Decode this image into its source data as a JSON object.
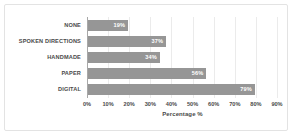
{
  "chart_data": {
    "type": "bar",
    "orientation": "horizontal",
    "title": "",
    "categories": [
      "NONE",
      "SPOKEN DIRECTIONS",
      "HANDMADE",
      "PAPER",
      "DIGITAL"
    ],
    "values": [
      19,
      37,
      34,
      56,
      79
    ],
    "value_labels": [
      "19%",
      "37%",
      "34%",
      "56%",
      "79%"
    ],
    "xlabel": "Percentage %",
    "ylabel": "",
    "xlim": [
      0,
      90
    ],
    "xticks": [
      0,
      10,
      20,
      30,
      40,
      50,
      60,
      70,
      80,
      90
    ],
    "xtick_labels": [
      "0%",
      "10%",
      "20%",
      "30%",
      "40%",
      "50%",
      "60%",
      "70%",
      "80%",
      "90%"
    ],
    "grid": "vertical",
    "legend": null,
    "colors": {
      "bar": "#969696",
      "value_label": "#ffffff",
      "axis_text": "#4a4a4a",
      "gridline": "#ebebeb",
      "axis_line": "#a8a8a8",
      "frame": "#e3e3e3",
      "background": "#ffffff"
    }
  }
}
